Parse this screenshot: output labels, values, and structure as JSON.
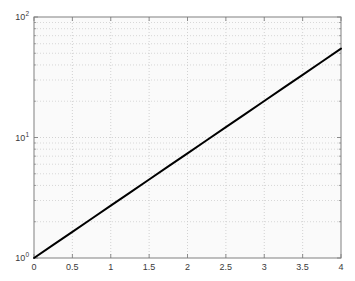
{
  "figure": {
    "background_color": "#ffffff",
    "axes_background_color": "#fafafa",
    "axes_border_color": "#808080",
    "grid_color": "#c8c8c8",
    "line_color": "#000000",
    "tick_text_color": "#3a3a3a"
  },
  "chart_data": {
    "type": "line",
    "title": "",
    "xlabel": "",
    "ylabel": "",
    "xscale": "linear",
    "yscale": "log",
    "xlim": [
      0,
      4
    ],
    "ylim": [
      1,
      100
    ],
    "grid": true,
    "minor_grid": true,
    "legend": null,
    "x_ticks": [
      0,
      0.5,
      1,
      1.5,
      2,
      2.5,
      3,
      3.5,
      4
    ],
    "x_tick_labels": [
      "0",
      "0.5",
      "1",
      "1.5",
      "2",
      "2.5",
      "3",
      "3.5",
      "4"
    ],
    "y_ticks": [
      1,
      10,
      100
    ],
    "y_tick_labels": [
      {
        "mantissa": "10",
        "exponent": "0",
        "value": 1
      },
      {
        "mantissa": "10",
        "exponent": "1",
        "value": 10
      },
      {
        "mantissa": "10",
        "exponent": "2",
        "value": 100
      }
    ],
    "y_minor_ticks": [
      2,
      3,
      4,
      5,
      6,
      7,
      8,
      9,
      20,
      30,
      40,
      50,
      60,
      70,
      80,
      90
    ],
    "series": [
      {
        "name": "exp(x)",
        "color": "#000000",
        "line_width": 2,
        "x": [
          0,
          0.25,
          0.5,
          0.75,
          1,
          1.25,
          1.5,
          1.75,
          2,
          2.25,
          2.5,
          2.75,
          3,
          3.25,
          3.5,
          3.75,
          4
        ],
        "y": [
          1,
          1.284,
          1.649,
          2.117,
          2.718,
          3.49,
          4.482,
          5.755,
          7.389,
          9.488,
          12.182,
          15.643,
          20.086,
          25.79,
          33.115,
          42.521,
          54.598
        ]
      }
    ]
  }
}
